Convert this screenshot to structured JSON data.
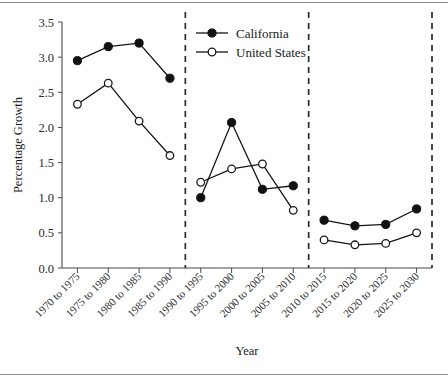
{
  "chart_data": {
    "type": "line",
    "title": "",
    "xlabel": "Year",
    "ylabel": "Percentage Growth",
    "ylim": [
      0.0,
      3.5
    ],
    "yticks": [
      "0.0",
      "0.5",
      "1.0",
      "1.5",
      "2.0",
      "2.5",
      "3.0",
      "3.5"
    ],
    "ytick_values": [
      0.0,
      0.5,
      1.0,
      1.5,
      2.0,
      2.5,
      3.0,
      3.5
    ],
    "grid": false,
    "legend_position": "top-center",
    "categories": [
      "1970 to 1975",
      "1975 to 1980",
      "1980 to 1985",
      "1985 to 1990",
      "1990 to 1995",
      "1995 to 2000",
      "2000 to 2005",
      "2005 to 2010",
      "2010 to 2015",
      "2015 to 2020",
      "2020 to 2025",
      "2025 to 2030"
    ],
    "series": [
      {
        "name": "California",
        "marker": "filled-circle",
        "values": [
          2.95,
          3.15,
          3.2,
          2.7,
          1.0,
          2.07,
          1.12,
          1.17,
          0.68,
          0.6,
          0.62,
          0.84
        ]
      },
      {
        "name": "United States",
        "marker": "open-circle",
        "values": [
          2.33,
          2.63,
          2.09,
          1.6,
          1.22,
          1.41,
          1.48,
          0.82,
          0.4,
          0.33,
          0.35,
          0.5
        ]
      }
    ],
    "segment_breaks": [
      4,
      8,
      12
    ],
    "annotations": [
      "Dashed vertical dividers separate three four-period panels: historical (1970-1990), recent (1990-2010), and projected (2010-2030)."
    ]
  },
  "legend": {
    "items": [
      {
        "label": "California",
        "marker": "filled-circle"
      },
      {
        "label": "United States",
        "marker": "open-circle"
      }
    ]
  },
  "colors": {
    "series_line": "#141414",
    "marker_fill": "#111111",
    "marker_open_fill": "#ffffff",
    "axis": "#4a4a4a",
    "divider": "#2b2b2b",
    "text": "#1a1a1a",
    "background": "#ffffff"
  }
}
